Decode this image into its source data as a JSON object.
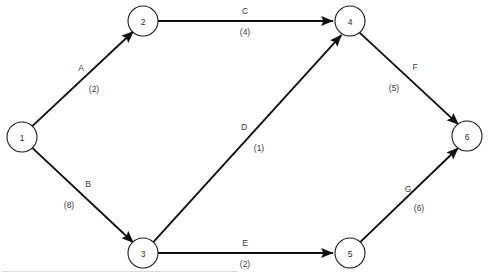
{
  "diagram": {
    "line_color": "#111111",
    "node_stroke_color": "#1a1a1a",
    "node_fill_color": "#ffffff",
    "text_color": "#3a3a3a",
    "node_radius": 15
  },
  "nodes": [
    {
      "id": "1",
      "label": "1",
      "x": 22,
      "y": 137
    },
    {
      "id": "2",
      "label": "2",
      "x": 143,
      "y": 21
    },
    {
      "id": "3",
      "label": "3",
      "x": 143,
      "y": 253
    },
    {
      "id": "4",
      "label": "4",
      "x": 350,
      "y": 21
    },
    {
      "id": "5",
      "label": "5",
      "x": 350,
      "y": 253
    },
    {
      "id": "6",
      "label": "6",
      "x": 467,
      "y": 136
    }
  ],
  "edges": [
    {
      "id": "A",
      "name": "A",
      "weight": "(2)",
      "from": "1",
      "to": "2",
      "arrow": true,
      "name_x": 81,
      "name_y": 68,
      "weight_x": 94,
      "weight_y": 89
    },
    {
      "id": "B",
      "name": "B",
      "weight": "(8)",
      "from": "1",
      "to": "3",
      "arrow": true,
      "name_x": 88,
      "name_y": 184,
      "weight_x": 69,
      "weight_y": 205
    },
    {
      "id": "C",
      "name": "C",
      "weight": "(4)",
      "from": "2",
      "to": "4",
      "arrow": true,
      "name_x": 245,
      "name_y": 11,
      "weight_x": 245,
      "weight_y": 32
    },
    {
      "id": "D",
      "name": "D",
      "weight": "(1)",
      "from": "3",
      "to": "4",
      "arrow": true,
      "name_x": 244,
      "name_y": 127,
      "weight_x": 259,
      "weight_y": 148
    },
    {
      "id": "E",
      "name": "E",
      "weight": "(2)",
      "from": "3",
      "to": "5",
      "arrow": true,
      "name_x": 245,
      "name_y": 243,
      "weight_x": 245,
      "weight_y": 264
    },
    {
      "id": "F",
      "name": "F",
      "weight": "(5)",
      "from": "4",
      "to": "6",
      "arrow": true,
      "name_x": 415,
      "name_y": 67,
      "weight_x": 394,
      "weight_y": 88
    },
    {
      "id": "G",
      "name": "G",
      "weight": "(6)",
      "from": "5",
      "to": "6",
      "arrow": true,
      "name_x": 408,
      "name_y": 189,
      "weight_x": 419,
      "weight_y": 208
    }
  ]
}
